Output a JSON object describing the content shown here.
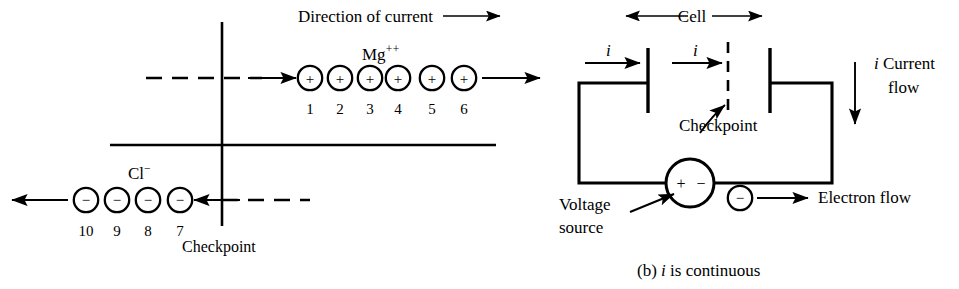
{
  "figure": {
    "caption": "(b) i is continuous",
    "caption_prefix": "(b)",
    "caption_italic": "i",
    "caption_rest": "is continuous"
  },
  "left_panel": {
    "direction_label": "Direction of current",
    "cation_label_base": "Mg",
    "cation_label_sup": "++",
    "anion_label_base": "Cl",
    "anion_label_sup": "−",
    "checkpoint_label": "Checkpoint",
    "cation_sign": "+",
    "anion_sign": "−",
    "cation_numbers": [
      "1",
      "2",
      "3",
      "4",
      "5",
      "6"
    ],
    "anion_numbers": [
      "10",
      "9",
      "8",
      "7"
    ]
  },
  "right_panel": {
    "cell_label": "Cell",
    "current_label_left": "i",
    "current_label_right": "i",
    "current_flow_italic": "i",
    "current_flow_line1": "Current",
    "current_flow_line2": "flow",
    "checkpoint_label": "Checkpoint",
    "voltage_source_line1": "Voltage",
    "voltage_source_line2": "source",
    "electron_flow_label": "Electron flow",
    "source_plus": "+",
    "source_minus": "−",
    "electron_sign": "−"
  },
  "colors": {
    "ink": "#000000",
    "paper": "#ffffff"
  }
}
